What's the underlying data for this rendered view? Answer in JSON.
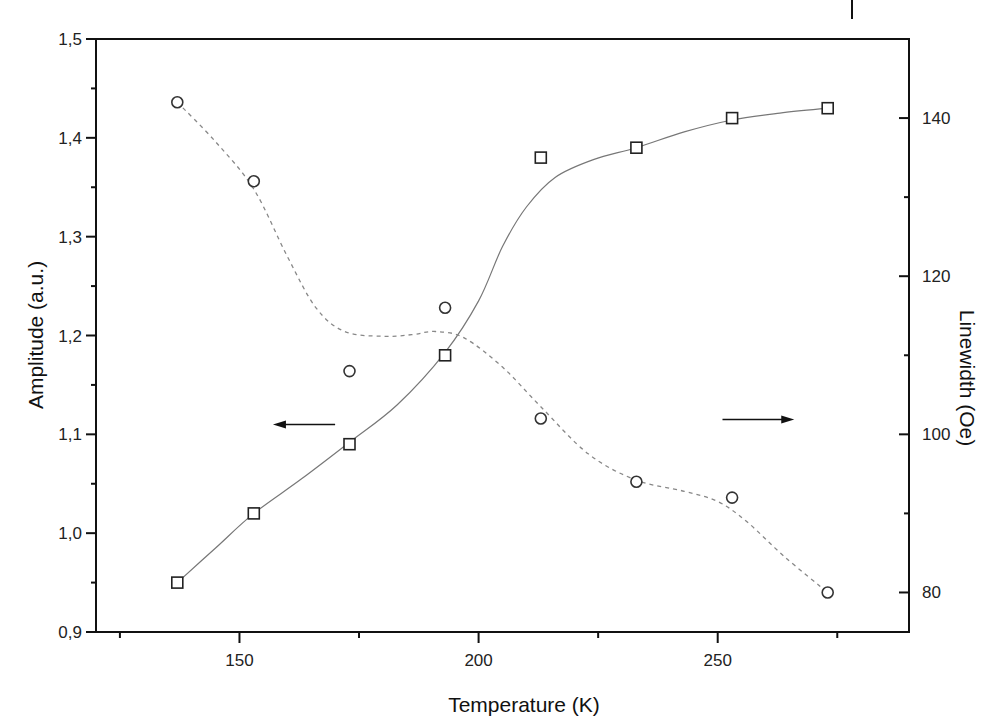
{
  "chart_data": {
    "type": "scatter",
    "title": "",
    "xlabel": "Temperature (K)",
    "ylabel": "Amplitude (a.u.)",
    "y2label": "Linewidth (Oe)",
    "xlim": [
      120,
      290
    ],
    "ylim": [
      0.9,
      1.5
    ],
    "y2lim": [
      75,
      150
    ],
    "grid": false,
    "legend": "none",
    "x_ticks": [
      125,
      150,
      175,
      200,
      225,
      250,
      275
    ],
    "x_tick_labels": [
      "",
      "150",
      "",
      "200",
      "",
      "250",
      ""
    ],
    "y_ticks": [
      0.9,
      0.95,
      1.0,
      1.05,
      1.1,
      1.15,
      1.2,
      1.25,
      1.3,
      1.35,
      1.4,
      1.45,
      1.5
    ],
    "y_tick_labels": [
      "0,9",
      "",
      "1,0",
      "",
      "1,1",
      "",
      "1,2",
      "",
      "1,3",
      "",
      "1,4",
      "",
      "1,5"
    ],
    "y2_ticks": [
      80,
      90,
      100,
      110,
      120,
      130,
      140
    ],
    "y2_tick_labels": [
      "80",
      "",
      "100",
      "",
      "120",
      "",
      "140"
    ],
    "x": [
      137,
      153,
      173,
      193,
      213,
      233,
      253,
      273
    ],
    "series": [
      {
        "name": "Amplitude",
        "axis": "left",
        "marker": "square",
        "line": "solid smoothed fit",
        "values": [
          0.95,
          1.02,
          1.09,
          1.18,
          1.38,
          1.39,
          1.42,
          1.43
        ]
      },
      {
        "name": "Linewidth",
        "axis": "right",
        "marker": "circle",
        "line": "dashed smoothed fit",
        "values": [
          142,
          132,
          108,
          116,
          102,
          94,
          92,
          80
        ]
      }
    ],
    "annotations": [
      {
        "type": "arrow",
        "direction": "left",
        "meaning": "squares refer to left axis (Amplitude)",
        "x_from": 170,
        "x_to": 157,
        "y": 1.11
      },
      {
        "type": "arrow",
        "direction": "right",
        "meaning": "circles refer to right axis (Linewidth)",
        "x_from": 251,
        "x_to": 266,
        "y": 1.115
      }
    ],
    "fit_curves": {
      "solid": [
        [
          137,
          0.95
        ],
        [
          145,
          0.985
        ],
        [
          153,
          1.02
        ],
        [
          163,
          1.055
        ],
        [
          173,
          1.092
        ],
        [
          183,
          1.13
        ],
        [
          193,
          1.183
        ],
        [
          200,
          1.235
        ],
        [
          205,
          1.29
        ],
        [
          210,
          1.33
        ],
        [
          216,
          1.36
        ],
        [
          224,
          1.378
        ],
        [
          233,
          1.39
        ],
        [
          243,
          1.406
        ],
        [
          253,
          1.418
        ],
        [
          263,
          1.425
        ],
        [
          273,
          1.43
        ]
      ],
      "dashed": [
        [
          137,
          142
        ],
        [
          145,
          137
        ],
        [
          153,
          131
        ],
        [
          160,
          122.5
        ],
        [
          166,
          116
        ],
        [
          172,
          113
        ],
        [
          180,
          112.4
        ],
        [
          186,
          112.6
        ],
        [
          191,
          113
        ],
        [
          197,
          112.2
        ],
        [
          205,
          108.5
        ],
        [
          213,
          103.5
        ],
        [
          223,
          97.5
        ],
        [
          233,
          94.2
        ],
        [
          243,
          92.8
        ],
        [
          250,
          91.5
        ],
        [
          256,
          89
        ],
        [
          264,
          84.5
        ],
        [
          273,
          80
        ]
      ]
    }
  },
  "labels": {
    "xlabel": "Temperature (K)",
    "ylabel": "Amplitude (a.u.)",
    "y2label": "Linewidth (Oe)"
  }
}
